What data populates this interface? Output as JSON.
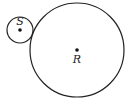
{
  "diagram": {
    "circles": [
      {
        "id": "S",
        "label": "S",
        "cx": 20,
        "cy": 30,
        "r": 13
      },
      {
        "id": "R",
        "label": "R",
        "cx": 77,
        "cy": 50,
        "r": 47
      }
    ],
    "relation": "externally tangent circles",
    "stroke_color": "#222222"
  }
}
